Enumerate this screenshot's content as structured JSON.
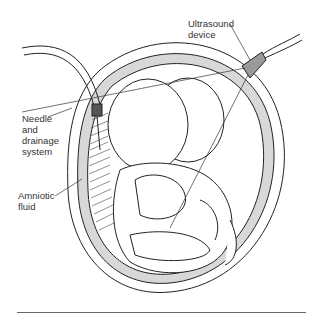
{
  "figure": {
    "type": "medical-illustration",
    "top_cut_text": "——",
    "labels": [
      {
        "id": "ultrasound",
        "text": "Ultrasound\ndevice"
      },
      {
        "id": "needle",
        "text": "Needle\nand\ndrainage\nsystem"
      },
      {
        "id": "amniotic",
        "text": "Amniotic\nfluid"
      }
    ]
  },
  "colors": {
    "line": "#222222",
    "shade": "#bdbdbd",
    "probe": "#9a9a9a",
    "rule": "#666666"
  }
}
